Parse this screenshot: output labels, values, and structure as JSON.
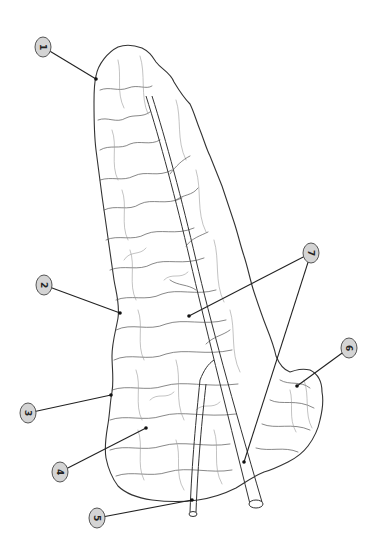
{
  "diagram": {
    "orientation": "rotated 90 degrees clockwise",
    "colors": {
      "background": "#ffffff",
      "outline": "#333333",
      "callout_fill": "#d4d4d4",
      "callout_stroke": "#555555",
      "leader_line": "#222222"
    },
    "callouts": [
      {
        "id": "1",
        "label": "1",
        "cx": 43,
        "cy": 47,
        "targets": [
          [
            96,
            79
          ]
        ]
      },
      {
        "id": "2",
        "label": "2",
        "cx": 44,
        "cy": 285,
        "targets": [
          [
            120,
            313
          ]
        ]
      },
      {
        "id": "3",
        "label": "3",
        "cx": 28,
        "cy": 413,
        "targets": [
          [
            111,
            395
          ]
        ]
      },
      {
        "id": "4",
        "label": "4",
        "cx": 60,
        "cy": 472,
        "targets": [
          [
            146,
            428
          ]
        ]
      },
      {
        "id": "5",
        "label": "5",
        "cx": 97,
        "cy": 518,
        "targets": [
          [
            190,
            500
          ]
        ]
      },
      {
        "id": "6",
        "label": "6",
        "cx": 349,
        "cy": 348,
        "targets": [
          [
            297,
            386
          ]
        ]
      },
      {
        "id": "7",
        "label": "7",
        "cx": 311,
        "cy": 253,
        "targets": [
          [
            189,
            316
          ],
          [
            244,
            462
          ]
        ]
      }
    ]
  }
}
